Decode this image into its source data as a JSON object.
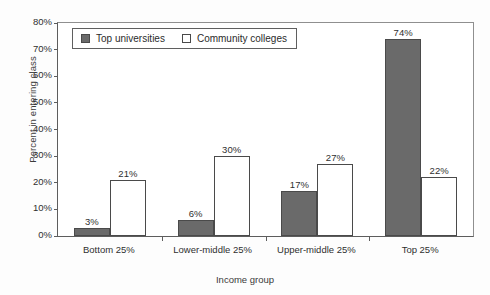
{
  "chart_data": {
    "type": "bar",
    "title": "",
    "subtitle": "",
    "xlabel": "Income group",
    "ylabel": "Percent in entering class",
    "categories": [
      "Bottom 25%",
      "Lower-middle 25%",
      "Upper-middle 25%",
      "Top 25%"
    ],
    "series": [
      {
        "name": "Top universities",
        "values": [
          3,
          6,
          17,
          74
        ],
        "value_labels": [
          "3%",
          "6%",
          "17%",
          "74%"
        ],
        "fill": "#6a6a6a",
        "border": "#4a4a4a",
        "style": "filled"
      },
      {
        "name": "Community colleges",
        "values": [
          21,
          30,
          27,
          22
        ],
        "value_labels": [
          "21%",
          "30%",
          "27%",
          "22%"
        ],
        "fill": "#ffffff",
        "border": "#4a4a4a",
        "style": "hollow"
      }
    ],
    "ylim": [
      0,
      80
    ],
    "ytick_values": [
      80,
      70,
      60,
      50,
      40,
      30,
      20,
      10,
      0
    ],
    "ytick_labels": [
      "80%",
      "70%",
      "60%",
      "50%",
      "40%",
      "30%",
      "20%",
      "10%",
      "0%"
    ],
    "grid": false,
    "legend_position": "upper-left-inside",
    "value_labels_shown": true
  },
  "legend": {
    "entries": [
      {
        "label": "Top universities",
        "swatch": "filled-square-icon"
      },
      {
        "label": "Community colleges",
        "swatch": "hollow-square-icon"
      }
    ]
  },
  "axes": {
    "y_title": "Percent in entering class",
    "x_title": "Income group"
  }
}
